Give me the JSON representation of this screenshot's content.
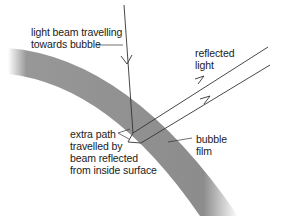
{
  "diagram": {
    "colors": {
      "background": "#ffffff",
      "film": "#8c8c8c",
      "line": "#333333",
      "text": "#1a1a1a"
    },
    "labels": {
      "incident": [
        "light beam travelling",
        "towards bubble"
      ],
      "reflected": [
        "reflected",
        "light"
      ],
      "extra_path": [
        "extra path",
        "travelled by",
        "beam reflected",
        "from inside surface"
      ],
      "film": [
        "bubble",
        "film"
      ]
    }
  }
}
